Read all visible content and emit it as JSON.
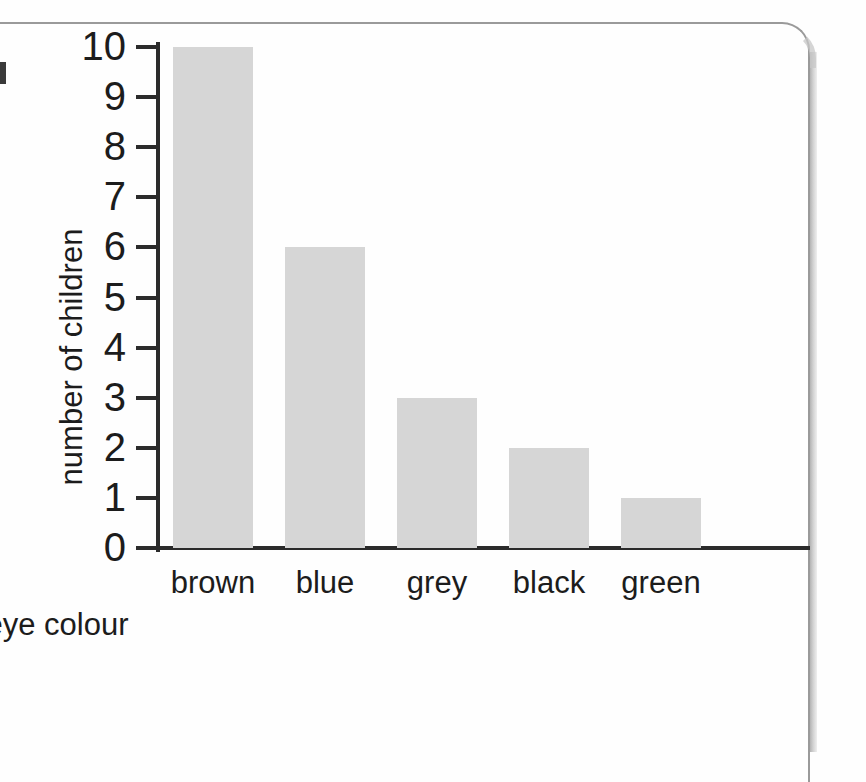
{
  "chart_data": {
    "type": "bar",
    "title": "",
    "xlabel": "eye colour",
    "ylabel": "number of children",
    "categories": [
      "brown",
      "blue",
      "grey",
      "black",
      "green"
    ],
    "values": [
      10,
      6,
      3,
      2,
      1
    ],
    "ytick_labels": [
      "0",
      "1",
      "2",
      "3",
      "4",
      "5",
      "6",
      "7",
      "8",
      "9",
      "10"
    ],
    "ylim": [
      0,
      10
    ],
    "ytick_step": 1,
    "grid": false,
    "legend": "none",
    "bar_color": "#d6d6d6",
    "axis_color": "#2b2b2b",
    "text_color": "#1c1c1c"
  },
  "page": {
    "background_color": "#fefefe",
    "border_color": "#9a9a9a",
    "edge_mark_color": "#3a3a3a"
  }
}
